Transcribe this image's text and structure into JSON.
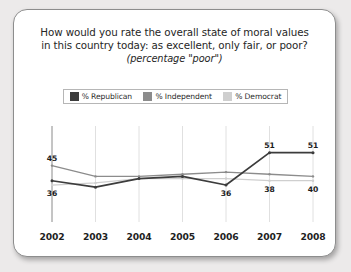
{
  "card": {
    "title_line1": "How would you rate the overall state of moral values",
    "title_line2": "in this country today: as excellent, only fair, or poor?",
    "subtitle": "(percentage \"poor\")"
  },
  "legend": {
    "items": [
      {
        "label": "% Republican",
        "color": "#3c3c3c",
        "icon": "legend-swatch-icon"
      },
      {
        "label": "% Independent",
        "color": "#8c8c8c",
        "icon": "legend-swatch-icon"
      },
      {
        "label": "% Democrat",
        "color": "#cfcfcf",
        "icon": "legend-swatch-icon"
      }
    ]
  },
  "chart_data": {
    "type": "line",
    "title": "How would you rate the overall state of moral values in this country today: as excellent, only fair, or poor?",
    "subtitle": "(percentage \"poor\")",
    "xlabel": "",
    "ylabel": "",
    "ylim": [
      30,
      55
    ],
    "grid": true,
    "legend_position": "top",
    "categories": [
      "2002",
      "2003",
      "2004",
      "2005",
      "2006",
      "2007",
      "2008"
    ],
    "series": [
      {
        "name": "% Republican",
        "color": "#3c3c3c",
        "values": [
          38,
          35,
          39,
          40,
          36,
          51,
          51
        ]
      },
      {
        "name": "% Independent",
        "color": "#8c8c8c",
        "values": [
          45,
          40,
          40,
          41,
          42,
          41,
          40
        ]
      },
      {
        "name": "% Democrat",
        "color": "#cfcfcf",
        "values": [
          36,
          37,
          39,
          39,
          39,
          38,
          38
        ]
      }
    ],
    "point_labels": [
      {
        "text": "45",
        "series": "% Independent",
        "category": "2002",
        "position": "above"
      },
      {
        "text": "36",
        "series": "% Democrat",
        "category": "2002",
        "position": "below"
      },
      {
        "text": "36",
        "series": "% Republican",
        "category": "2006",
        "position": "below"
      },
      {
        "text": "51",
        "series": "% Republican",
        "category": "2007",
        "position": "above"
      },
      {
        "text": "38",
        "series": "% Democrat",
        "category": "2007",
        "position": "below"
      },
      {
        "text": "51",
        "series": "% Republican",
        "category": "2008",
        "position": "above"
      },
      {
        "text": "40",
        "series": "% Democrat",
        "category": "2008",
        "position": "below"
      }
    ]
  },
  "xaxis": {
    "ticks": [
      "2002",
      "2003",
      "2004",
      "2005",
      "2006",
      "2007",
      "2008"
    ]
  }
}
